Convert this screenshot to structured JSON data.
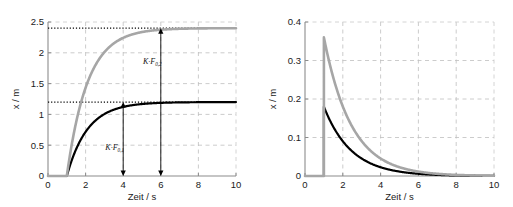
{
  "figure": {
    "background_color": "#ffffff",
    "panels": [
      "left",
      "right"
    ]
  },
  "chart_data": [
    {
      "id": "left-panel",
      "type": "line",
      "title": "",
      "xlabel": "Zeit / s",
      "ylabel": "x / m",
      "xlim": [
        0,
        10
      ],
      "ylim": [
        0,
        2.5
      ],
      "xticks": [
        0,
        2,
        4,
        6,
        8,
        10
      ],
      "xticklabels": [
        "0",
        "2",
        "4",
        "6",
        "8",
        "10"
      ],
      "yticks": [
        0,
        0.5,
        1,
        1.5,
        2,
        2.5
      ],
      "yticklabels": [
        "0",
        "0.5",
        "1",
        "1.5",
        "2",
        "2.5"
      ],
      "grid": true,
      "grid_style": "dashed",
      "grid_color": "#bfbfbf",
      "legend": "none",
      "series": [
        {
          "name": "Sprungantwort 1",
          "color": "#000000",
          "linewidth": 2.2,
          "description": "Step response, first order, delay 1 s, steady state 1.2 m, time constant 1.1 s",
          "step_time": 1,
          "steady_state": 1.2,
          "time_constant": 1.1,
          "x": [
            0,
            0.5,
            1.0,
            1.2,
            1.4,
            1.6,
            1.8,
            2.0,
            2.4,
            2.8,
            3.2,
            3.6,
            4.0,
            4.5,
            5.0,
            5.5,
            6.0,
            7.0,
            8.0,
            9.0,
            10.0
          ],
          "y": [
            0,
            0,
            0,
            0.196,
            0.372,
            0.529,
            0.67,
            0.795,
            1.0,
            1.15,
            1.25,
            1.32,
            1.18,
            1.18,
            1.19,
            1.195,
            1.198,
            1.2,
            1.2,
            1.2,
            1.2
          ]
        },
        {
          "name": "Sprungantwort 2",
          "color": "#a6a6a6",
          "linewidth": 2.6,
          "description": "Step response, first order, delay 1 s, steady state 2.4 m, time constant 1.1 s",
          "step_time": 1,
          "steady_state": 2.4,
          "time_constant": 1.1,
          "x": [
            0,
            0.5,
            1.0,
            1.2,
            1.4,
            1.6,
            1.8,
            2.0,
            2.4,
            2.8,
            3.2,
            3.6,
            4.0,
            4.5,
            5.0,
            5.5,
            6.0,
            7.0,
            8.0,
            9.0,
            10.0
          ],
          "y": [
            0,
            0,
            0,
            0.392,
            0.744,
            1.058,
            1.34,
            1.59,
            2.0,
            2.3,
            2.5,
            2.64,
            2.36,
            2.37,
            2.38,
            2.39,
            2.396,
            2.4,
            2.4,
            2.4,
            2.4
          ]
        }
      ],
      "reference_lines": [
        {
          "kind": "horizontal-dotted",
          "y": 1.2,
          "color": "#000000"
        },
        {
          "kind": "horizontal-dotted",
          "y": 2.4,
          "color": "#000000"
        }
      ],
      "annotations": [
        {
          "id": "annot-kf01",
          "text": "K·F",
          "subscript": "0,1",
          "arrow_x": 4,
          "arrow_y_from": 1.2,
          "arrow_y_to": 0,
          "label_x": 3.05,
          "label_y": 0.42,
          "double_headed": true
        },
        {
          "id": "annot-kf02",
          "text": "K·F",
          "subscript": "0,2",
          "arrow_x": 6,
          "arrow_y_from": 2.4,
          "arrow_y_to": 0,
          "label_x": 5.05,
          "label_y": 1.82,
          "double_headed": true
        }
      ]
    },
    {
      "id": "right-panel",
      "type": "line",
      "title": "",
      "xlabel": "Zeit / s",
      "ylabel": "x / m",
      "xlim": [
        0,
        10
      ],
      "ylim": [
        0,
        0.4
      ],
      "xticks": [
        0,
        2,
        4,
        6,
        8,
        10
      ],
      "xticklabels": [
        "0",
        "2",
        "4",
        "6",
        "8",
        "10"
      ],
      "yticks": [
        0,
        0.1,
        0.2,
        0.3,
        0.4
      ],
      "yticklabels": [
        "0",
        "0.1",
        "0.2",
        "0.3",
        "0.4"
      ],
      "grid": true,
      "grid_style": "dashed",
      "grid_color": "#bfbfbf",
      "legend": "none",
      "series": [
        {
          "name": "Impulsantwort 1",
          "color": "#000000",
          "linewidth": 2.2,
          "description": "Exponential decay from peak 0.18 m at t = 1 s, time constant about 1.45 s",
          "peak_time": 1,
          "peak_value": 0.18,
          "time_constant": 1.45,
          "x": [
            0,
            0.99,
            1.0,
            1.25,
            1.5,
            1.75,
            2.0,
            2.5,
            3.0,
            3.5,
            4.0,
            4.5,
            5.0,
            5.5,
            6.0,
            6.5,
            7.0,
            7.5,
            8.0,
            9.0,
            10.0
          ],
          "y": [
            0,
            0,
            0.18,
            0.152,
            0.128,
            0.108,
            0.091,
            0.065,
            0.046,
            0.033,
            0.023,
            0.0165,
            0.0117,
            0.0083,
            0.0059,
            0.0042,
            0.003,
            0.0021,
            0.0015,
            0.0007,
            0.0004
          ]
        },
        {
          "name": "Impulsantwort 2",
          "color": "#a6a6a6",
          "linewidth": 2.6,
          "description": "Exponential decay from peak 0.36 m at t = 1 s, time constant about 1.45 s",
          "peak_time": 1,
          "peak_value": 0.36,
          "time_constant": 1.45,
          "x": [
            0,
            0.99,
            1.0,
            1.25,
            1.5,
            1.75,
            2.0,
            2.5,
            3.0,
            3.5,
            4.0,
            4.5,
            5.0,
            5.5,
            6.0,
            6.5,
            7.0,
            7.5,
            8.0,
            9.0,
            10.0
          ],
          "y": [
            0,
            0,
            0.36,
            0.304,
            0.256,
            0.216,
            0.182,
            0.13,
            0.092,
            0.066,
            0.046,
            0.033,
            0.0234,
            0.0166,
            0.0118,
            0.0084,
            0.006,
            0.0042,
            0.003,
            0.0015,
            0.0008
          ]
        }
      ],
      "reference_lines": [],
      "annotations": []
    }
  ]
}
